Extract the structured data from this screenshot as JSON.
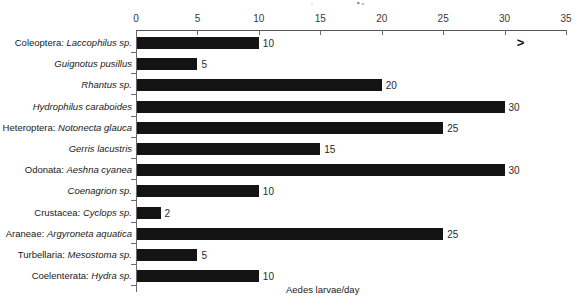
{
  "chart_data": {
    "type": "bar",
    "orientation": "horizontal",
    "title": "",
    "xlabel": "Aedes larvae/day",
    "ylabel": "",
    "xlim": [
      0,
      35
    ],
    "xticks": [
      0,
      5,
      10,
      15,
      20,
      25,
      30,
      35
    ],
    "grid": false,
    "legend": null,
    "bar_color": "#141414",
    "axis_color": "#6b6b6b",
    "categories": [
      "Coleoptera: Laccophilus sp.",
      "Guignotus pusillus",
      "Rhantus sp.",
      "Hydrophilus caraboides",
      "Heteroptera: Notonecta glauca",
      "Gerris lacustris",
      "Odonata: Aeshna cyanea",
      "Coenagrion sp.",
      "Crustacea: Cyclops sp.",
      "Araneae: Argyroneta aquatica",
      "Turbellaria: Mesostoma sp.",
      "Coelenterata: Hydra sp."
    ],
    "category_parts": [
      {
        "prefix": "Coleoptera: ",
        "species": "Laccophilus sp."
      },
      {
        "prefix": "",
        "species": "Guignotus pusillus"
      },
      {
        "prefix": "",
        "species": "Rhantus sp."
      },
      {
        "prefix": "",
        "species": "Hydrophilus caraboides"
      },
      {
        "prefix": "Heteroptera: ",
        "species": "Notonecta glauca"
      },
      {
        "prefix": "",
        "species": "Gerris lacustris"
      },
      {
        "prefix": "Odonata: ",
        "species": "Aeshna cyanea"
      },
      {
        "prefix": "",
        "species": "Coenagrion sp."
      },
      {
        "prefix": "Crustacea: ",
        "species": "Cyclops sp."
      },
      {
        "prefix": "Araneae: ",
        "species": "Argyroneta aquatica"
      },
      {
        "prefix": "Turbellaria: ",
        "species": "Mesostoma sp."
      },
      {
        "prefix": "Coelenterata: ",
        "species": "Hydra sp."
      }
    ],
    "values": [
      10,
      5,
      20,
      30,
      25,
      15,
      30,
      10,
      2,
      25,
      5,
      10
    ],
    "value_labels": [
      "10",
      "5",
      "20",
      "30",
      "25",
      "15",
      "30",
      "10",
      "2",
      "25",
      "5",
      "10"
    ],
    "annotations": [
      {
        "text": ">",
        "x": 31,
        "row": 0
      }
    ]
  }
}
